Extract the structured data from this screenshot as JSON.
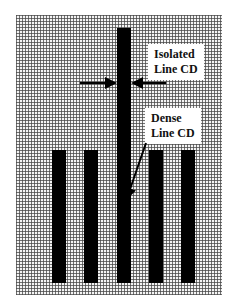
{
  "diagram": {
    "type": "lithography-line-cd-schematic",
    "background": "grid",
    "colors": {
      "line": "#000000",
      "grid": "#464646",
      "label_bg": "#ffffff"
    },
    "isolated_label": {
      "line1": "Isolated",
      "line2": "Line CD"
    },
    "dense_label": {
      "line1": "Dense",
      "line2": "Line CD"
    },
    "bars": [
      {
        "name": "dense-line-1",
        "x": 52,
        "y": 150,
        "w": 14,
        "h": 133
      },
      {
        "name": "dense-line-2",
        "x": 84,
        "y": 150,
        "w": 14,
        "h": 133
      },
      {
        "name": "isolated-line",
        "x": 117,
        "y": 28,
        "w": 14,
        "h": 255
      },
      {
        "name": "dense-line-4",
        "x": 149,
        "y": 150,
        "w": 14,
        "h": 133
      },
      {
        "name": "dense-line-5",
        "x": 181,
        "y": 150,
        "w": 14,
        "h": 133
      }
    ]
  }
}
